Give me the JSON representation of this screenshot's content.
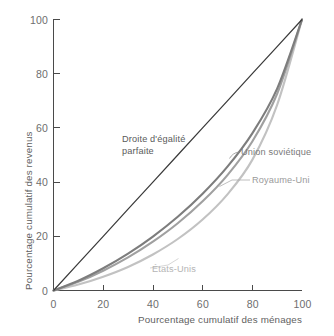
{
  "chart_data": {
    "type": "line",
    "title": "",
    "xlabel": "Pourcentage cumulatif des ménages",
    "ylabel": "Pourcentage cumulatif des revenus",
    "xlim": [
      0,
      100
    ],
    "ylim": [
      0,
      100
    ],
    "xticks": [
      "0",
      "20",
      "40",
      "60",
      "80",
      "100"
    ],
    "xtick_values": [
      0,
      20,
      40,
      60,
      80,
      100
    ],
    "yticks": [
      "0",
      "20",
      "40",
      "60",
      "80",
      "100"
    ],
    "ytick_values": [
      0,
      20,
      40,
      60,
      80,
      100
    ],
    "grid": false,
    "legend_position": "inline-annotations",
    "x": [
      0,
      10,
      20,
      30,
      40,
      50,
      60,
      70,
      80,
      90,
      100
    ],
    "series": [
      {
        "name": "Droite d'égalité parfaite",
        "label_line1": "Droite d'égalité",
        "label_line2": "parfaite",
        "color": "#3a3a3a",
        "width": 1.25,
        "values": [
          0,
          10,
          20,
          30,
          40,
          50,
          60,
          70,
          80,
          90,
          100
        ]
      },
      {
        "name": "Union soviétique",
        "label_line1": "Union soviétique",
        "label_line2": "",
        "color": "#7d7d7d",
        "width": 2.1,
        "values": [
          0,
          3.6,
          8.2,
          13.6,
          19.9,
          27.2,
          35.7,
          45.7,
          58.0,
          74.5,
          100
        ]
      },
      {
        "name": "Royaume-Uni",
        "label_line1": "Royaume-Uni",
        "label_line2": "",
        "color": "#a0a0a0",
        "width": 2.1,
        "values": [
          0,
          3.2,
          7.3,
          12.2,
          18.0,
          24.8,
          32.9,
          42.6,
          55.0,
          72.6,
          100
        ]
      },
      {
        "name": "États-Unis",
        "label_line1": "États-Unis",
        "label_line2": "",
        "color": "#c2c2c2",
        "width": 2.1,
        "values": [
          0,
          2.2,
          5.1,
          8.7,
          13.3,
          19.0,
          26.2,
          35.5,
          48.2,
          68.5,
          100
        ]
      }
    ],
    "annotations": [
      {
        "name": "equality-annotation",
        "text": "Droite d'égalité parfaite"
      },
      {
        "name": "soviet-annotation",
        "text": "Union soviétique"
      },
      {
        "name": "uk-annotation",
        "text": "Royaume-Uni"
      },
      {
        "name": "us-annotation",
        "text": "États-Unis"
      }
    ]
  }
}
